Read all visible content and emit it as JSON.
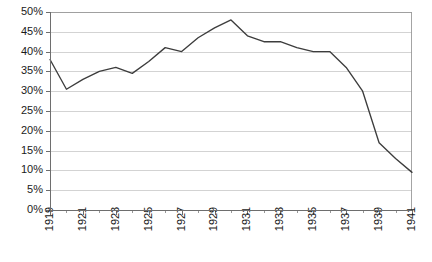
{
  "chart_data": {
    "type": "line",
    "title": "",
    "subtitle": "",
    "xlabel": "",
    "ylabel": "",
    "grid": true,
    "legend": false,
    "legend_position": "none",
    "xlim": [
      1919,
      1941
    ],
    "ylim": [
      0,
      50
    ],
    "x": [
      1919,
      1920,
      1921,
      1922,
      1923,
      1924,
      1925,
      1926,
      1927,
      1928,
      1929,
      1930,
      1931,
      1932,
      1933,
      1934,
      1935,
      1936,
      1937,
      1938,
      1939,
      1940,
      1941
    ],
    "values": [
      38.0,
      30.5,
      33.0,
      35.0,
      36.0,
      34.5,
      37.5,
      41.0,
      40.0,
      43.5,
      46.0,
      48.0,
      44.0,
      42.5,
      42.5,
      41.0,
      40.0,
      40.0,
      36.0,
      30.0,
      17.0,
      13.0,
      9.5
    ],
    "series": [
      {
        "name": "series-1",
        "color": "#3d3d3d",
        "values": [
          38.0,
          30.5,
          33.0,
          35.0,
          36.0,
          34.5,
          37.5,
          41.0,
          40.0,
          43.5,
          46.0,
          48.0,
          44.0,
          42.5,
          42.5,
          41.0,
          40.0,
          40.0,
          36.0,
          30.0,
          17.0,
          13.0,
          9.5
        ]
      }
    ],
    "ytick_values": [
      0,
      5,
      10,
      15,
      20,
      25,
      30,
      35,
      40,
      45,
      50
    ],
    "ytick_labels": [
      "0%",
      "5%",
      "10%",
      "15%",
      "20%",
      "25%",
      "30%",
      "35%",
      "40%",
      "45%",
      "50%"
    ],
    "xtick_values": [
      1919,
      1921,
      1923,
      1925,
      1927,
      1929,
      1931,
      1933,
      1935,
      1937,
      1939,
      1941
    ],
    "xtick_labels": [
      "1919",
      "1921",
      "1923",
      "1925",
      "1927",
      "1929",
      "1931",
      "1933",
      "1935",
      "1937",
      "1939",
      "1941"
    ],
    "xtick_minor_values": [
      1920,
      1922,
      1924,
      1926,
      1928,
      1930,
      1932,
      1934,
      1936,
      1938,
      1940
    ],
    "colors": {
      "line": "#3d3d3d",
      "gridline": "#c8c8c8",
      "axis": "#6e6e6e",
      "frame": "#9a9a9a",
      "text": "#1a1a1a",
      "background": "#ffffff",
      "plot_background": "#ffffff"
    }
  }
}
